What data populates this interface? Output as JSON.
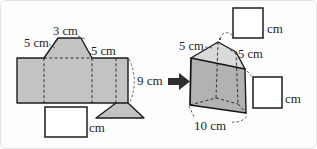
{
  "net": {
    "top_edge_label": "3 cm",
    "left_slant_label": "5 cm",
    "right_slant_label": "5 cm",
    "strip_height_label": "9 cm",
    "answer_box_unit_label": "cm"
  },
  "prism": {
    "top_left_edge_label": "5 cm",
    "top_right_edge_label": "5 cm",
    "bottom_edge_label": "10 cm",
    "top_answer_box_unit_label": "cm",
    "side_answer_box_unit_label": "cm"
  },
  "colors": {
    "net_fill": "#c3c3c3",
    "prism_front_fill": "#b2b2b2",
    "prism_top_fill": "#dadada",
    "arrow_fill": "#2e2e2e",
    "answer_box_fill": "#ffffff"
  }
}
